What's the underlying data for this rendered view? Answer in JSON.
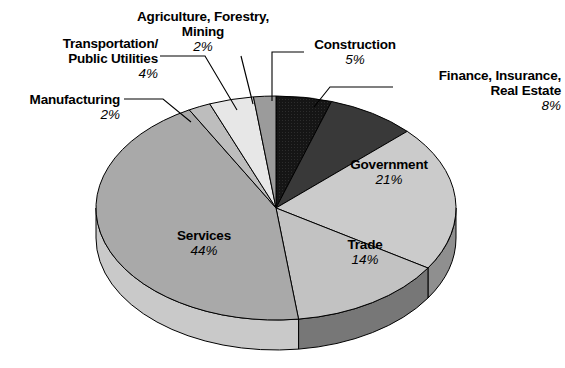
{
  "chart_data": {
    "type": "pie",
    "title": "",
    "subtitle": "",
    "xlabel": "",
    "ylabel": "",
    "legend_position": "none",
    "grid": false,
    "three_d": true,
    "units": "percent",
    "categories": [
      "Construction",
      "Finance, Insurance, Real Estate",
      "Government",
      "Trade",
      "Services",
      "Manufacturing",
      "Transportation/Public Utilities",
      "Agriculture, Forestry, Mining"
    ],
    "values": [
      5,
      8,
      21,
      14,
      44,
      2,
      4,
      2
    ],
    "slices": [
      {
        "id": "construction",
        "name": "Construction",
        "name_lines": [
          "Construction"
        ],
        "percent_label": "5%",
        "value": 5,
        "color": "#151515",
        "side_color": "#0c0c0c",
        "label_placement": "outside"
      },
      {
        "id": "finance",
        "name": "Finance, Insurance, Real Estate",
        "name_lines": [
          "Finance, Insurance,",
          "Real Estate"
        ],
        "percent_label": "8%",
        "value": 8,
        "color": "#393939",
        "side_color": "#232323",
        "label_placement": "outside"
      },
      {
        "id": "government",
        "name": "Government",
        "name_lines": [
          "Government"
        ],
        "percent_label": "21%",
        "value": 21,
        "color": "#cbcbcb",
        "side_color": "#8f8f8f",
        "label_placement": "inside"
      },
      {
        "id": "trade",
        "name": "Trade",
        "name_lines": [
          "Trade"
        ],
        "percent_label": "14%",
        "value": 14,
        "color": "#c2c2c2",
        "side_color": "#777777",
        "label_placement": "inside"
      },
      {
        "id": "services",
        "name": "Services",
        "name_lines": [
          "Services"
        ],
        "percent_label": "44%",
        "value": 44,
        "color": "#a9a9a9",
        "side_color": "#c9c9c9",
        "label_placement": "inside"
      },
      {
        "id": "manufacturing",
        "name": "Manufacturing",
        "name_lines": [
          "Manufacturing"
        ],
        "percent_label": "2%",
        "value": 2,
        "color": "#bdbdbd",
        "side_color": "#9a9a9a",
        "label_placement": "outside"
      },
      {
        "id": "transportation",
        "name": "Transportation/Public Utilities",
        "name_lines": [
          "Transportation/",
          "Public Utilities"
        ],
        "percent_label": "4%",
        "value": 4,
        "color": "#e7e7e7",
        "side_color": "#c0c0c0",
        "label_placement": "outside"
      },
      {
        "id": "agriculture",
        "name": "Agriculture, Forestry, Mining",
        "name_lines": [
          "Agriculture, Forestry,",
          "Mining"
        ],
        "percent_label": "2%",
        "value": 2,
        "color": "#9b9b9b",
        "side_color": "#7a7a7a",
        "label_placement": "outside"
      }
    ],
    "geometry": {
      "cx": 276,
      "cy": 208,
      "rx": 180,
      "ry": 112,
      "depth": 30,
      "start_angle_deg": -90,
      "direction": "clockwise"
    },
    "colors": {
      "background": "#ffffff",
      "outline": "#000000",
      "text": "#000000"
    }
  },
  "labels": {
    "transportation": {
      "line1": "Transportation/",
      "line2": "Public Utilities",
      "percent": "4%"
    },
    "agriculture": {
      "line1": "Agriculture, Forestry,",
      "line2": "Mining",
      "percent": "2%"
    },
    "manufacturing": {
      "line1": "Manufacturing",
      "percent": "2%"
    },
    "construction": {
      "line1": "Construction",
      "percent": "5%"
    },
    "finance": {
      "line1": "Finance, Insurance,",
      "line2": "Real Estate",
      "percent": "8%"
    },
    "government": {
      "line1": "Government",
      "percent": "21%"
    },
    "trade": {
      "line1": "Trade",
      "percent": "14%"
    },
    "services": {
      "line1": "Services",
      "percent": "44%"
    }
  }
}
